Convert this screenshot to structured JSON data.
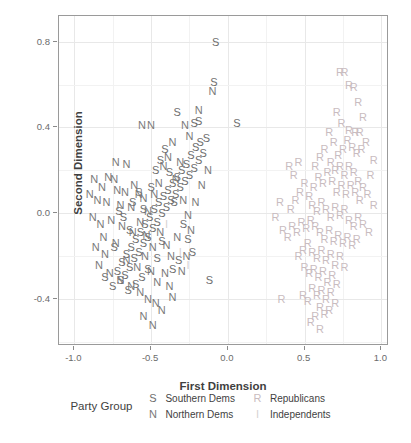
{
  "chart_data": {
    "type": "scatter",
    "title": "",
    "xlabel": "First Dimension",
    "ylabel": "Second Dimension",
    "xlim": [
      -1.1,
      1.05
    ],
    "ylim": [
      -0.62,
      0.92
    ],
    "xticks": [
      "-1.0",
      "-0.5",
      "0.0",
      "0.5",
      "1.0"
    ],
    "xtickvals": [
      -1.0,
      -0.5,
      0.0,
      0.5,
      1.0
    ],
    "yticks": [
      "0.8",
      "0.4",
      "0.0",
      "-0.4"
    ],
    "ytickvals": [
      0.8,
      0.4,
      0.0,
      -0.4
    ],
    "grid": true,
    "legend_position": "bottom",
    "legend_title": "Party Group",
    "marker_style": "text-glyph",
    "series": [
      {
        "name": "Southern Dems",
        "glyph": "S",
        "color": "#6e6e6e",
        "points": [
          [
            -0.08,
            0.8
          ],
          [
            -0.33,
            0.47
          ],
          [
            -0.09,
            0.61
          ],
          [
            -0.19,
            0.43
          ],
          [
            -0.22,
            0.42
          ],
          [
            0.06,
            0.42
          ],
          [
            -0.14,
            0.35
          ],
          [
            -0.18,
            0.33
          ],
          [
            -0.21,
            0.31
          ],
          [
            -0.16,
            0.28
          ],
          [
            -0.24,
            0.27
          ],
          [
            -0.19,
            0.25
          ],
          [
            -0.27,
            0.23
          ],
          [
            -0.22,
            0.21
          ],
          [
            -0.3,
            0.2
          ],
          [
            -0.25,
            0.18
          ],
          [
            -0.33,
            0.17
          ],
          [
            -0.28,
            0.15
          ],
          [
            -0.36,
            0.14
          ],
          [
            -0.31,
            0.12
          ],
          [
            -0.39,
            0.11
          ],
          [
            -0.34,
            0.09
          ],
          [
            -0.42,
            0.08
          ],
          [
            -0.37,
            0.06
          ],
          [
            -0.45,
            0.05
          ],
          [
            -0.4,
            0.03
          ],
          [
            -0.48,
            0.02
          ],
          [
            -0.43,
            0.0
          ],
          [
            -0.51,
            -0.02
          ],
          [
            -0.46,
            -0.04
          ],
          [
            -0.54,
            -0.05
          ],
          [
            -0.49,
            -0.07
          ],
          [
            -0.57,
            -0.09
          ],
          [
            -0.52,
            -0.11
          ],
          [
            -0.6,
            -0.12
          ],
          [
            -0.55,
            -0.14
          ],
          [
            -0.63,
            -0.16
          ],
          [
            -0.58,
            -0.18
          ],
          [
            -0.66,
            -0.19
          ],
          [
            -0.61,
            -0.21
          ],
          [
            -0.69,
            -0.23
          ],
          [
            -0.64,
            -0.25
          ],
          [
            -0.72,
            -0.27
          ],
          [
            -0.67,
            -0.29
          ],
          [
            -0.8,
            -0.3
          ],
          [
            -0.7,
            -0.31
          ],
          [
            -0.12,
            -0.31
          ],
          [
            -0.75,
            -0.34
          ],
          [
            -0.65,
            -0.36
          ],
          [
            -0.58,
            0.1
          ],
          [
            -0.62,
            0.05
          ],
          [
            -0.55,
            0.02
          ],
          [
            -0.5,
            0.12
          ],
          [
            -0.47,
            0.2
          ],
          [
            -0.44,
            0.25
          ],
          [
            -0.41,
            0.3
          ],
          [
            -0.38,
            0.19
          ],
          [
            -0.35,
            0.05
          ],
          [
            -0.29,
            -0.05
          ],
          [
            -0.26,
            -0.12
          ],
          [
            -0.23,
            -0.18
          ],
          [
            -0.32,
            -0.22
          ],
          [
            -0.36,
            -0.26
          ],
          [
            -0.43,
            -0.13
          ],
          [
            -0.46,
            -0.21
          ],
          [
            -0.52,
            -0.26
          ],
          [
            -0.56,
            -0.3
          ],
          [
            -0.6,
            -0.33
          ],
          [
            -0.64,
            -0.08
          ],
          [
            -0.68,
            -0.02
          ],
          [
            -0.71,
            0.01
          ],
          [
            -0.74,
            -0.16
          ]
        ]
      },
      {
        "name": "Northern Dems",
        "glyph": "N",
        "color": "#7a7a7a",
        "points": [
          [
            -0.56,
            0.41
          ],
          [
            -0.5,
            0.41
          ],
          [
            -0.28,
            0.41
          ],
          [
            -0.1,
            0.57
          ],
          [
            -0.19,
            0.48
          ],
          [
            -0.25,
            0.36
          ],
          [
            -0.36,
            0.33
          ],
          [
            -0.73,
            0.24
          ],
          [
            -0.66,
            0.23
          ],
          [
            -0.78,
            0.17
          ],
          [
            -0.74,
            0.16
          ],
          [
            -0.82,
            0.12
          ],
          [
            -0.72,
            0.11
          ],
          [
            -0.67,
            0.1
          ],
          [
            -0.61,
            0.13
          ],
          [
            -0.58,
            0.09
          ],
          [
            -0.85,
            0.06
          ],
          [
            -0.79,
            0.05
          ],
          [
            -0.7,
            0.04
          ],
          [
            -0.63,
            0.03
          ],
          [
            -0.55,
            0.07
          ],
          [
            -0.52,
            0.01
          ],
          [
            -0.48,
            0.09
          ],
          [
            -0.45,
            0.14
          ],
          [
            -0.42,
            0.22
          ],
          [
            -0.39,
            0.26
          ],
          [
            -0.31,
            0.24
          ],
          [
            -0.34,
            0.16
          ],
          [
            -0.88,
            -0.02
          ],
          [
            -0.83,
            -0.05
          ],
          [
            -0.76,
            -0.03
          ],
          [
            -0.69,
            -0.06
          ],
          [
            -0.62,
            -0.09
          ],
          [
            -0.57,
            -0.04
          ],
          [
            -0.53,
            -0.1
          ],
          [
            -0.49,
            -0.16
          ],
          [
            -0.44,
            -0.09
          ],
          [
            -0.4,
            -0.15
          ],
          [
            -0.37,
            -0.2
          ],
          [
            -0.33,
            -0.11
          ],
          [
            -0.86,
            -0.16
          ],
          [
            -0.8,
            -0.19
          ],
          [
            -0.73,
            -0.14
          ],
          [
            -0.66,
            -0.22
          ],
          [
            -0.59,
            -0.25
          ],
          [
            -0.54,
            -0.2
          ],
          [
            -0.5,
            -0.27
          ],
          [
            -0.46,
            -0.32
          ],
          [
            -0.41,
            -0.28
          ],
          [
            -0.38,
            -0.34
          ],
          [
            -0.84,
            -0.24
          ],
          [
            -0.77,
            -0.28
          ],
          [
            -0.7,
            -0.31
          ],
          [
            -0.63,
            -0.34
          ],
          [
            -0.57,
            -0.37
          ],
          [
            -0.52,
            -0.4
          ],
          [
            -0.47,
            -0.42
          ],
          [
            -0.43,
            -0.45
          ],
          [
            -0.55,
            -0.48
          ],
          [
            -0.49,
            -0.52
          ],
          [
            -0.36,
            -0.39
          ],
          [
            -0.3,
            -0.27
          ],
          [
            -0.27,
            -0.2
          ],
          [
            -0.24,
            -0.08
          ],
          [
            -0.21,
            0.05
          ],
          [
            -0.17,
            0.13
          ],
          [
            -0.13,
            0.2
          ],
          [
            -0.29,
            0.06
          ],
          [
            -0.26,
            -0.01
          ],
          [
            -0.9,
            0.09
          ],
          [
            -0.87,
            0.16
          ],
          [
            -0.81,
            -0.11
          ]
        ]
      },
      {
        "name": "Republicans",
        "glyph": "R",
        "color": "#c9bcc0",
        "points": [
          [
            0.73,
            0.66
          ],
          [
            0.76,
            0.66
          ],
          [
            0.79,
            0.6
          ],
          [
            0.82,
            0.59
          ],
          [
            0.85,
            0.52
          ],
          [
            0.88,
            0.45
          ],
          [
            0.79,
            0.39
          ],
          [
            0.83,
            0.38
          ],
          [
            0.86,
            0.38
          ],
          [
            0.74,
            0.42
          ],
          [
            0.71,
            0.47
          ],
          [
            0.9,
            0.33
          ],
          [
            0.87,
            0.3
          ],
          [
            0.84,
            0.28
          ],
          [
            0.81,
            0.31
          ],
          [
            0.78,
            0.34
          ],
          [
            0.75,
            0.3
          ],
          [
            0.72,
            0.27
          ],
          [
            0.69,
            0.33
          ],
          [
            0.66,
            0.38
          ],
          [
            0.63,
            0.3
          ],
          [
            0.6,
            0.26
          ],
          [
            0.57,
            0.22
          ],
          [
            0.67,
            0.24
          ],
          [
            0.7,
            0.2
          ],
          [
            0.73,
            0.22
          ],
          [
            0.76,
            0.18
          ],
          [
            0.79,
            0.22
          ],
          [
            0.82,
            0.19
          ],
          [
            0.85,
            0.15
          ],
          [
            0.88,
            0.12
          ],
          [
            0.91,
            0.09
          ],
          [
            0.86,
            0.06
          ],
          [
            0.83,
            0.1
          ],
          [
            0.8,
            0.13
          ],
          [
            0.77,
            0.09
          ],
          [
            0.74,
            0.13
          ],
          [
            0.71,
            0.1
          ],
          [
            0.68,
            0.15
          ],
          [
            0.65,
            0.19
          ],
          [
            0.62,
            0.14
          ],
          [
            0.59,
            0.17
          ],
          [
            0.56,
            0.12
          ],
          [
            0.53,
            0.08
          ],
          [
            0.5,
            0.14
          ],
          [
            0.47,
            0.1
          ],
          [
            0.44,
            0.06
          ],
          [
            0.41,
            0.02
          ],
          [
            0.55,
            0.04
          ],
          [
            0.58,
            0.01
          ],
          [
            0.61,
            0.05
          ],
          [
            0.64,
            0.02
          ],
          [
            0.67,
            -0.02
          ],
          [
            0.7,
            0.03
          ],
          [
            0.73,
            -0.01
          ],
          [
            0.76,
            0.02
          ],
          [
            0.79,
            -0.03
          ],
          [
            0.82,
            -0.06
          ],
          [
            0.85,
            -0.02
          ],
          [
            0.88,
            -0.05
          ],
          [
            0.57,
            -0.06
          ],
          [
            0.54,
            -0.03
          ],
          [
            0.51,
            -0.07
          ],
          [
            0.48,
            -0.04
          ],
          [
            0.45,
            -0.09
          ],
          [
            0.42,
            -0.06
          ],
          [
            0.39,
            -0.11
          ],
          [
            0.36,
            -0.08
          ],
          [
            0.6,
            -0.09
          ],
          [
            0.63,
            -0.12
          ],
          [
            0.66,
            -0.08
          ],
          [
            0.69,
            -0.13
          ],
          [
            0.72,
            -0.1
          ],
          [
            0.75,
            -0.14
          ],
          [
            0.78,
            -0.11
          ],
          [
            0.81,
            -0.15
          ],
          [
            0.84,
            -0.12
          ],
          [
            0.52,
            -0.14
          ],
          [
            0.49,
            -0.17
          ],
          [
            0.46,
            -0.2
          ],
          [
            0.55,
            -0.18
          ],
          [
            0.58,
            -0.21
          ],
          [
            0.61,
            -0.17
          ],
          [
            0.64,
            -0.22
          ],
          [
            0.67,
            -0.19
          ],
          [
            0.7,
            -0.24
          ],
          [
            0.73,
            -0.2
          ],
          [
            0.76,
            -0.25
          ],
          [
            0.5,
            -0.25
          ],
          [
            0.53,
            -0.28
          ],
          [
            0.56,
            -0.26
          ],
          [
            0.59,
            -0.3
          ],
          [
            0.62,
            -0.27
          ],
          [
            0.65,
            -0.32
          ],
          [
            0.68,
            -0.29
          ],
          [
            0.71,
            -0.33
          ],
          [
            0.55,
            -0.35
          ],
          [
            0.58,
            -0.38
          ],
          [
            0.61,
            -0.36
          ],
          [
            0.64,
            -0.4
          ],
          [
            0.67,
            -0.37
          ],
          [
            0.7,
            -0.42
          ],
          [
            0.52,
            -0.41
          ],
          [
            0.49,
            -0.38
          ],
          [
            0.6,
            -0.44
          ],
          [
            0.63,
            -0.47
          ],
          [
            0.66,
            -0.45
          ],
          [
            0.57,
            -0.48
          ],
          [
            0.54,
            -0.51
          ],
          [
            0.6,
            -0.54
          ],
          [
            0.35,
            -0.4
          ],
          [
            0.93,
            0.18
          ],
          [
            0.95,
            0.04
          ],
          [
            0.92,
            -0.09
          ],
          [
            0.4,
            0.22
          ],
          [
            0.43,
            0.18
          ],
          [
            0.46,
            0.24
          ],
          [
            0.95,
            0.25
          ],
          [
            0.34,
            0.05
          ],
          [
            0.31,
            -0.02
          ]
        ]
      },
      {
        "name": "Independents",
        "glyph": "I",
        "color": "#d6d2d2",
        "points": [
          [
            -0.26,
            -0.24
          ],
          [
            -0.31,
            -0.18
          ],
          [
            -0.4,
            -0.05
          ]
        ]
      }
    ]
  },
  "legend": {
    "title": "Party Group",
    "entries": [
      {
        "glyph": "S",
        "label": "Southern Dems",
        "color": "#6e6e6e"
      },
      {
        "glyph": "R",
        "label": "Republicans",
        "color": "#c9bcc0"
      },
      {
        "glyph": "N",
        "label": "Northern Dems",
        "color": "#7a7a7a"
      },
      {
        "glyph": "I",
        "label": "Independents",
        "color": "#d6d2d2"
      }
    ]
  }
}
